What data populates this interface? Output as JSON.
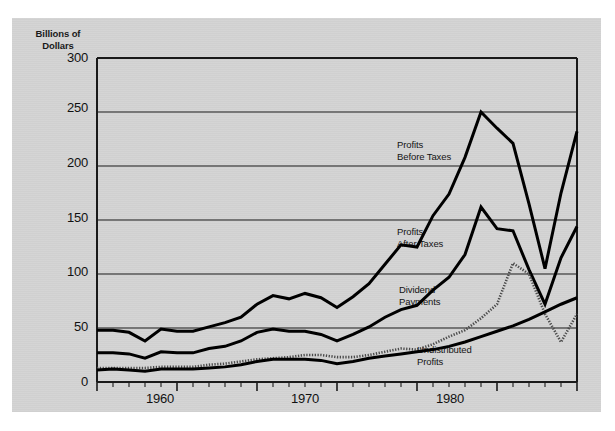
{
  "chart_data": {
    "type": "line",
    "title": "",
    "ylabel": "Billions of\nDollars",
    "xlabel": "",
    "ylim": [
      0,
      300
    ],
    "xlim": [
      1955,
      1985
    ],
    "yticks": [
      0,
      50,
      100,
      150,
      200,
      250,
      300
    ],
    "ytick_labels": [
      "0",
      "50",
      "100",
      "150",
      "200",
      "250",
      "300"
    ],
    "xticks": [
      1960,
      1970,
      1980
    ],
    "xtick_labels": [
      "1960",
      "1970",
      "1980"
    ],
    "xtick_minor_step": 1,
    "grid": "horizontal",
    "legend": "inline-annotations",
    "x": [
      1955,
      1956,
      1957,
      1958,
      1959,
      1960,
      1961,
      1962,
      1963,
      1964,
      1965,
      1966,
      1967,
      1968,
      1969,
      1970,
      1971,
      1972,
      1973,
      1974,
      1975,
      1976,
      1977,
      1978,
      1979,
      1980,
      1981,
      1982,
      1983,
      1984,
      1985
    ],
    "series": [
      {
        "name": "Profits Before Taxes",
        "style": "solid-thick",
        "color": "#000000",
        "values": [
          48,
          48,
          46,
          38,
          49,
          47,
          47,
          51,
          55,
          60,
          72,
          80,
          77,
          82,
          78,
          69,
          79,
          91,
          109,
          127,
          125,
          154,
          174,
          208,
          250,
          235,
          221,
          165,
          105,
          175,
          232
        ]
      },
      {
        "name": "Profits After Taxes",
        "style": "solid-thick",
        "color": "#000000",
        "values": [
          27,
          27,
          26,
          22,
          28,
          27,
          27,
          31,
          33,
          38,
          46,
          49,
          47,
          47,
          44,
          38,
          44,
          51,
          60,
          67,
          71,
          85,
          97,
          118,
          162,
          142,
          140,
          104,
          72,
          115,
          144
        ]
      },
      {
        "name": "Dividend Payments",
        "style": "dotted",
        "color": "#4a4a4a",
        "values": [
          13,
          13,
          13,
          13,
          14,
          14,
          14,
          16,
          17,
          19,
          21,
          22,
          23,
          25,
          25,
          23,
          23,
          25,
          28,
          31,
          30,
          35,
          42,
          48,
          59,
          72,
          110,
          100,
          63,
          37,
          63
        ]
      },
      {
        "name": "Undistributed Profits",
        "style": "solid-thick",
        "color": "#000000",
        "values": [
          11,
          12,
          11,
          10,
          12,
          12,
          12,
          13,
          14,
          16,
          19,
          21,
          21,
          21,
          20,
          17,
          19,
          22,
          24,
          26,
          28,
          30,
          33,
          37,
          42,
          47,
          52,
          58,
          65,
          72,
          78
        ]
      }
    ],
    "annotations": [
      {
        "text": "Profits\nBefore Taxes",
        "x": 1977.2,
        "y": 207
      },
      {
        "text": "Profits\nAfter Taxes",
        "x": 1977.2,
        "y": 139
      },
      {
        "text": "Dividend\nPayments",
        "x": 1977.4,
        "y": 84
      },
      {
        "text": "Undistributed\nProfits",
        "x": 1978.6,
        "y": 31
      }
    ]
  },
  "colors": {
    "panel_background": "#d4d4d4",
    "page_background": "#ffffff",
    "frame": "#1a1a1a",
    "gridline": "#1a1a1a",
    "line_solid": "#000000",
    "line_dotted": "#4a4a4a",
    "text": "#111111"
  }
}
